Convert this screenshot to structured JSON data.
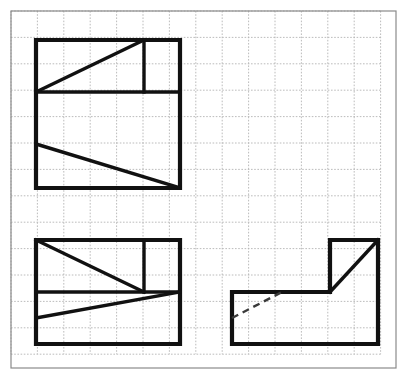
{
  "canvas": {
    "width": 407,
    "height": 381,
    "background": "#ffffff",
    "title": "Orthographic projection exercise with three views on dotted grid paper"
  },
  "grid": {
    "origin_x": 11,
    "origin_y": 11,
    "cell_size": 26.4,
    "cols": 14,
    "rows": 13,
    "line_color": "#b4b4b4",
    "line_width": 0.9,
    "dash_pattern": "1.6 1.6",
    "border_color": "#8a8a8a",
    "border_width": 1.2,
    "border_x": 11,
    "border_y": 11,
    "border_width_px": 385,
    "border_height_px": 357
  },
  "style": {
    "solid_color": "#111111",
    "solid_width": 4.2,
    "thin_solid_width": 3.4,
    "hidden_color": "#3a3a3a",
    "hidden_width": 2.4,
    "hidden_dash": "7 5"
  },
  "figures": [
    {
      "id": "top-left-view",
      "name": "front-view",
      "label": "Top-left view",
      "outline": [
        [
          36,
          40
        ],
        [
          180,
          40
        ],
        [
          180,
          188
        ],
        [
          36,
          188
        ]
      ],
      "solid_lines": [
        {
          "name": "horizontal-divider",
          "from": [
            36,
            92
          ],
          "to": [
            180,
            92
          ]
        },
        {
          "name": "vertical-divider",
          "from": [
            144,
            40
          ],
          "to": [
            144,
            92
          ]
        },
        {
          "name": "upper-diagonal",
          "from": [
            36,
            92
          ],
          "to": [
            144,
            40
          ]
        },
        {
          "name": "lower-diagonal",
          "from": [
            36,
            144
          ],
          "to": [
            180,
            188
          ]
        }
      ],
      "hidden_lines": []
    },
    {
      "id": "bottom-left-view",
      "name": "top-view",
      "label": "Bottom-left view",
      "outline": [
        [
          36,
          240
        ],
        [
          180,
          240
        ],
        [
          180,
          344
        ],
        [
          36,
          344
        ]
      ],
      "solid_lines": [
        {
          "name": "horizontal-divider",
          "from": [
            36,
            292
          ],
          "to": [
            180,
            292
          ]
        },
        {
          "name": "vertical-divider",
          "from": [
            144,
            240
          ],
          "to": [
            144,
            292
          ]
        },
        {
          "name": "upper-diagonal",
          "from": [
            36,
            240
          ],
          "to": [
            144,
            292
          ]
        },
        {
          "name": "lower-diagonal",
          "from": [
            36,
            318
          ],
          "to": [
            180,
            292
          ]
        }
      ],
      "hidden_lines": []
    },
    {
      "id": "bottom-right-view",
      "name": "side-view",
      "label": "Bottom-right view",
      "outline": [
        [
          232,
          292
        ],
        [
          330,
          292
        ],
        [
          330,
          240
        ],
        [
          378,
          240
        ],
        [
          378,
          344
        ],
        [
          232,
          344
        ]
      ],
      "solid_lines": [
        {
          "name": "corner-diagonal",
          "from": [
            330,
            292
          ],
          "to": [
            378,
            240
          ]
        }
      ],
      "hidden_lines": [
        {
          "name": "hidden-diagonal",
          "from": [
            232,
            318
          ],
          "to": [
            282,
            292
          ]
        }
      ]
    }
  ]
}
